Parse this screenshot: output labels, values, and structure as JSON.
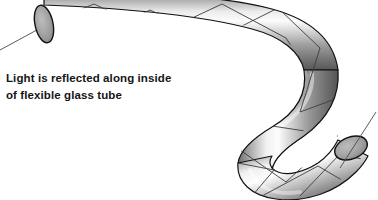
{
  "figure": {
    "title": "Light is reflected along inside of flexible glass tube",
    "background_color": "#ffffff",
    "caption": {
      "line1": "Light is reflected along inside",
      "line2": "of flexible glass tube",
      "color": "#151515",
      "x": 6,
      "y_line1": 82,
      "y_line2": 99
    },
    "tube": {
      "label": "flexible glass tube",
      "outline_color": "#111111",
      "outline_width": 1.2,
      "highlight_color": "#f2f2f2",
      "midtone_color": "#b4b4b4",
      "shadow_color": "#5a5a5a",
      "deep_shadow_color": "#4a4a4a"
    },
    "openings": [
      {
        "name": "entrance-aperture",
        "cx": 44,
        "cy": 24,
        "rx": 9,
        "ry": 19,
        "rotation": -12,
        "fill_color": "#9c9c9c",
        "outline_color": "#111111"
      },
      {
        "name": "exit-aperture",
        "cx": 351,
        "cy": 148,
        "rx": 17,
        "ry": 11,
        "rotation": -22,
        "fill_color": "#9c9c9c",
        "outline_color": "#111111"
      }
    ],
    "rays": {
      "color": "#3a3a3a",
      "width": 0.9,
      "entering_ray": "from lower-left into entrance aperture",
      "exiting_ray": "from exit aperture toward upper-right",
      "description": "Light zigzags by total internal reflection between the tube walls"
    }
  }
}
